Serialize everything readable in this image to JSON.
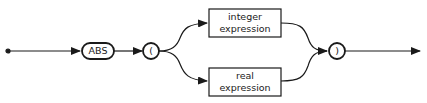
{
  "diagram": {
    "type": "syntax-railroad",
    "start": "entry-dot",
    "keyword": "ABS",
    "open_paren": "(",
    "close_paren": ")",
    "branches": [
      {
        "line1": "integer",
        "line2": "expression"
      },
      {
        "line1": "real",
        "line2": "expression"
      }
    ]
  }
}
